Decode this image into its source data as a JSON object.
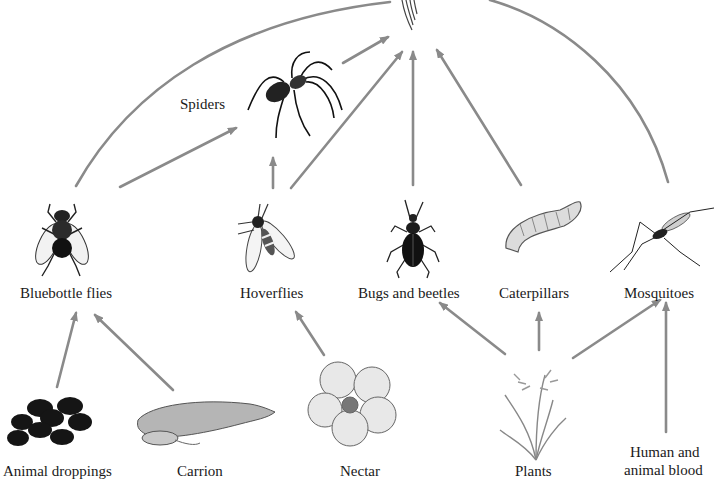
{
  "diagram": {
    "type": "food-web",
    "arrow_color": "#8a8a8a",
    "top_node": {
      "name": "top-predator-bird",
      "label": ""
    },
    "nodes": [
      {
        "id": "spiders",
        "label": "Spiders"
      },
      {
        "id": "bluebottle_flies",
        "label": "Bluebottle flies"
      },
      {
        "id": "hoverflies",
        "label": "Hoverflies"
      },
      {
        "id": "bugs_beetles",
        "label": "Bugs and beetles"
      },
      {
        "id": "caterpillars",
        "label": "Caterpillars"
      },
      {
        "id": "mosquitoes",
        "label": "Mosquitoes"
      },
      {
        "id": "animal_droppings",
        "label": "Animal droppings"
      },
      {
        "id": "carrion",
        "label": "Carrion"
      },
      {
        "id": "nectar",
        "label": "Nectar"
      },
      {
        "id": "plants",
        "label": "Plants"
      },
      {
        "id": "blood",
        "label_line1": "Human and",
        "label_line2": "animal blood"
      }
    ],
    "edges": [
      {
        "from": "animal_droppings",
        "to": "bluebottle_flies"
      },
      {
        "from": "carrion",
        "to": "bluebottle_flies"
      },
      {
        "from": "nectar",
        "to": "hoverflies"
      },
      {
        "from": "plants",
        "to": "bugs_beetles"
      },
      {
        "from": "plants",
        "to": "caterpillars"
      },
      {
        "from": "plants",
        "to": "mosquitoes"
      },
      {
        "from": "blood",
        "to": "mosquitoes"
      },
      {
        "from": "bluebottle_flies",
        "to": "spiders"
      },
      {
        "from": "hoverflies",
        "to": "spiders"
      },
      {
        "from": "bluebottle_flies",
        "to": "top_node"
      },
      {
        "from": "spiders",
        "to": "top_node"
      },
      {
        "from": "hoverflies",
        "to": "top_node"
      },
      {
        "from": "bugs_beetles",
        "to": "top_node"
      },
      {
        "from": "caterpillars",
        "to": "top_node"
      },
      {
        "from": "mosquitoes",
        "to": "top_node"
      }
    ]
  }
}
